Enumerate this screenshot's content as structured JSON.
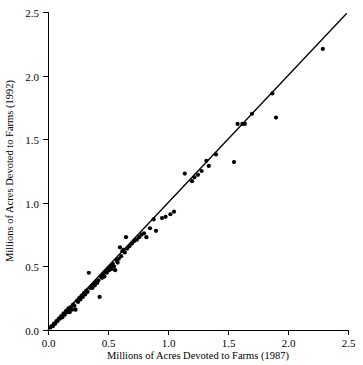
{
  "chart_data": {
    "type": "scatter",
    "title": "",
    "xlabel": "Millions of Acres Devoted to Farms (1987)",
    "ylabel": "Millions of Acres Devoted to Farms (1992)",
    "xlim": [
      0.0,
      2.5
    ],
    "ylim": [
      0.0,
      2.5
    ],
    "xticks": [
      0.0,
      0.5,
      1.0,
      1.5,
      2.0,
      2.5
    ],
    "yticks": [
      0.0,
      0.5,
      1.0,
      1.5,
      2.0,
      2.5
    ],
    "xtick_labels": [
      "0.0",
      "0.5",
      "1.0",
      "1.5",
      "2.0",
      "2.5"
    ],
    "ytick_labels": [
      "0.0",
      "0.5",
      "1.0",
      "1.5",
      "2.0",
      "2.5"
    ],
    "grid": false,
    "legend": false,
    "legend_position": "none",
    "point_color": "#000000",
    "line_color": "#000000",
    "reference_line": {
      "label": "y = x identity line",
      "x": [
        0.0,
        2.49
      ],
      "y": [
        0.0,
        2.49
      ]
    },
    "series": [
      {
        "name": "Counties",
        "marker": "filled-circle",
        "points": [
          [
            0.02,
            0.02
          ],
          [
            0.03,
            0.03
          ],
          [
            0.04,
            0.03
          ],
          [
            0.05,
            0.05
          ],
          [
            0.06,
            0.05
          ],
          [
            0.07,
            0.07
          ],
          [
            0.08,
            0.07
          ],
          [
            0.09,
            0.09
          ],
          [
            0.1,
            0.09
          ],
          [
            0.11,
            0.11
          ],
          [
            0.12,
            0.1
          ],
          [
            0.13,
            0.13
          ],
          [
            0.14,
            0.12
          ],
          [
            0.15,
            0.15
          ],
          [
            0.16,
            0.14
          ],
          [
            0.17,
            0.17
          ],
          [
            0.18,
            0.14
          ],
          [
            0.19,
            0.18
          ],
          [
            0.2,
            0.16
          ],
          [
            0.21,
            0.2
          ],
          [
            0.22,
            0.19
          ],
          [
            0.23,
            0.16
          ],
          [
            0.24,
            0.23
          ],
          [
            0.25,
            0.22
          ],
          [
            0.26,
            0.25
          ],
          [
            0.27,
            0.24
          ],
          [
            0.28,
            0.27
          ],
          [
            0.29,
            0.26
          ],
          [
            0.3,
            0.29
          ],
          [
            0.31,
            0.28
          ],
          [
            0.32,
            0.31
          ],
          [
            0.33,
            0.3
          ],
          [
            0.34,
            0.45
          ],
          [
            0.35,
            0.33
          ],
          [
            0.36,
            0.34
          ],
          [
            0.37,
            0.33
          ],
          [
            0.38,
            0.36
          ],
          [
            0.39,
            0.35
          ],
          [
            0.4,
            0.38
          ],
          [
            0.41,
            0.37
          ],
          [
            0.42,
            0.39
          ],
          [
            0.43,
            0.26
          ],
          [
            0.44,
            0.42
          ],
          [
            0.45,
            0.41
          ],
          [
            0.46,
            0.44
          ],
          [
            0.47,
            0.42
          ],
          [
            0.48,
            0.46
          ],
          [
            0.49,
            0.45
          ],
          [
            0.5,
            0.48
          ],
          [
            0.51,
            0.47
          ],
          [
            0.52,
            0.5
          ],
          [
            0.53,
            0.48
          ],
          [
            0.54,
            0.52
          ],
          [
            0.55,
            0.5
          ],
          [
            0.56,
            0.47
          ],
          [
            0.57,
            0.55
          ],
          [
            0.58,
            0.53
          ],
          [
            0.59,
            0.56
          ],
          [
            0.6,
            0.65
          ],
          [
            0.61,
            0.58
          ],
          [
            0.62,
            0.62
          ],
          [
            0.63,
            0.63
          ],
          [
            0.64,
            0.61
          ],
          [
            0.65,
            0.73
          ],
          [
            0.66,
            0.64
          ],
          [
            0.68,
            0.66
          ],
          [
            0.7,
            0.68
          ],
          [
            0.72,
            0.7
          ],
          [
            0.74,
            0.71
          ],
          [
            0.76,
            0.73
          ],
          [
            0.78,
            0.75
          ],
          [
            0.8,
            0.76
          ],
          [
            0.82,
            0.73
          ],
          [
            0.85,
            0.8
          ],
          [
            0.88,
            0.87
          ],
          [
            0.9,
            0.78
          ],
          [
            0.95,
            0.88
          ],
          [
            0.98,
            0.89
          ],
          [
            1.02,
            0.91
          ],
          [
            1.05,
            0.93
          ],
          [
            1.14,
            1.23
          ],
          [
            1.2,
            1.17
          ],
          [
            1.22,
            1.2
          ],
          [
            1.25,
            1.22
          ],
          [
            1.28,
            1.25
          ],
          [
            1.32,
            1.33
          ],
          [
            1.34,
            1.29
          ],
          [
            1.4,
            1.38
          ],
          [
            1.55,
            1.32
          ],
          [
            1.58,
            1.62
          ],
          [
            1.62,
            1.62
          ],
          [
            1.64,
            1.62
          ],
          [
            1.7,
            1.7
          ],
          [
            1.87,
            1.86
          ],
          [
            1.9,
            1.67
          ],
          [
            2.29,
            2.21
          ]
        ]
      }
    ]
  },
  "figure": {
    "background_color": "#ffffff",
    "axis_color": "#000000"
  }
}
